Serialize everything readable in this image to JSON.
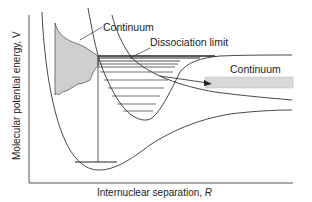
{
  "diagram": {
    "y_axis_label": "Molecular potential energy, V",
    "x_axis_label_prefix": "Internuclear separation, ",
    "x_axis_label_var": "R",
    "labels": {
      "continuum_left": "Continuum",
      "dissociation_limit": "Dissociation limit",
      "continuum_right": "Continuum"
    },
    "colors": {
      "line": "#333333",
      "shade": "#cfcfcf",
      "band": "#d8d8d8",
      "text": "#222222"
    }
  }
}
